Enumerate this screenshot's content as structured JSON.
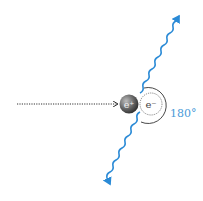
{
  "diagram": {
    "type": "positron-electron-annihilation",
    "particles": {
      "positron": {
        "label": "e⁺",
        "fill": "#5a5a5a"
      },
      "electron": {
        "label": "e⁻",
        "stroke": "#555555"
      }
    },
    "angle_label": "180°",
    "colors": {
      "photon": "#2a8ad6",
      "angle_text": "#4a9ad8",
      "trajectory": "#333333"
    },
    "elements": [
      "incoming-positron-trajectory",
      "positron",
      "electron",
      "gamma-photon-up-right",
      "gamma-photon-down-left",
      "angle-arc"
    ]
  }
}
